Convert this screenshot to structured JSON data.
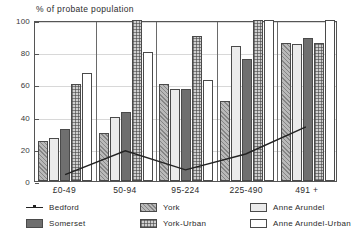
{
  "chart_data": {
    "type": "bar",
    "title": "% of probate population",
    "ylabel": "% of probate population",
    "xlabel": "",
    "ylim": [
      0,
      100
    ],
    "yticks": [
      0,
      20,
      40,
      60,
      80,
      100
    ],
    "grid": true,
    "legend_position": "bottom",
    "categories": [
      "£0-49",
      "50-94",
      "95-224",
      "225-490",
      "491 +"
    ],
    "series": [
      {
        "name": "Bedford",
        "type": "line",
        "color": "#222222",
        "values": [
          4,
          19,
          7,
          17,
          34
        ]
      },
      {
        "name": "Somerset",
        "type": "bar",
        "color": "#6f6f6f",
        "values": [
          32,
          43,
          57,
          76,
          89
        ]
      },
      {
        "name": "York",
        "type": "bar",
        "color": "#b9b9b9",
        "values": [
          25,
          30,
          60,
          50,
          86
        ]
      },
      {
        "name": "York-Urban",
        "type": "bar",
        "color": "#cfcfcf",
        "values": [
          60,
          100,
          90,
          100,
          86
        ]
      },
      {
        "name": "Anne Arundel",
        "type": "bar",
        "color": "#ebebeb",
        "values": [
          27,
          40,
          57,
          84,
          85
        ]
      },
      {
        "name": "Anne Arundel-Urban",
        "type": "bar",
        "color": "#ffffff",
        "values": [
          67,
          80,
          63,
          100,
          100
        ]
      }
    ],
    "bar_order": [
      "York",
      "Anne Arundel",
      "Somerset",
      "York-Urban",
      "Anne Arundel-Urban"
    ]
  },
  "legend": {
    "items": [
      {
        "label": "Bedford",
        "style": "line",
        "key": "bedford"
      },
      {
        "label": "Somerset",
        "style": "somerset",
        "key": "somerset"
      },
      {
        "label": "York",
        "style": "york",
        "key": "york"
      },
      {
        "label": "York-Urban",
        "style": "yorkurban",
        "key": "yorkurban"
      },
      {
        "label": "Anne Arundel",
        "style": "annearundel",
        "key": "annearundel"
      },
      {
        "label": "Anne Arundel-Urban",
        "style": "annearundelurban",
        "key": "annearundelurban"
      }
    ]
  },
  "axis": {
    "y_label_0": "0",
    "y_label_20": "20",
    "y_label_40": "40",
    "y_label_60": "60",
    "y_label_80": "80",
    "y_label_100": "100"
  }
}
